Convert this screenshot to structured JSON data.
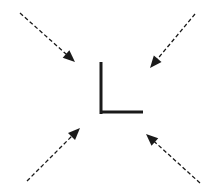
{
  "diagram": {
    "colors": {
      "background": "#ffffff",
      "stroke": "#1a1a1a"
    },
    "center_shape": {
      "name": "L-corner",
      "vertical": {
        "x": 101,
        "y1": 62,
        "y2": 113
      },
      "horizontal": {
        "x1": 101,
        "x2": 143,
        "y": 112
      }
    },
    "arrows": [
      {
        "name": "top-left",
        "from": [
          20,
          13
        ],
        "to": [
          75,
          62
        ]
      },
      {
        "name": "top-right",
        "from": [
          195,
          14
        ],
        "to": [
          150,
          68
        ]
      },
      {
        "name": "bottom-left",
        "from": [
          27,
          181
        ],
        "to": [
          80,
          128
        ]
      },
      {
        "name": "bottom-right",
        "from": [
          200,
          183
        ],
        "to": [
          146,
          134
        ]
      }
    ]
  }
}
